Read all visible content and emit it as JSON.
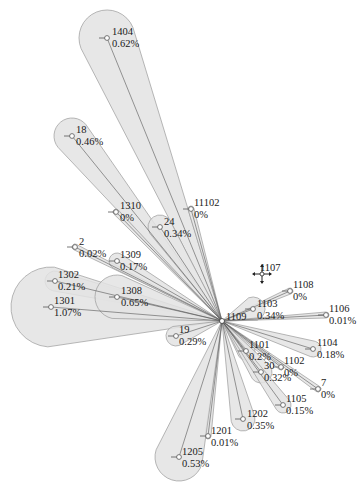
{
  "diagram": {
    "type": "radial-bubble-tree",
    "hub": {
      "x": 222,
      "y": 321
    },
    "colors": {
      "fill": "#e3e3e3",
      "stroke": "#9a9a9a",
      "line": "#555555",
      "text": "#1a1a1a"
    },
    "cursor": {
      "icon": "move-cursor-icon",
      "x": 262,
      "y": 274
    },
    "nodes": [
      {
        "id": "1404",
        "pct": "0.62%",
        "x": 107,
        "y": 38,
        "r": 28,
        "lx": 112,
        "ly": 26
      },
      {
        "id": "18",
        "pct": "0.46%",
        "x": 72,
        "y": 136,
        "r": 18,
        "lx": 76,
        "ly": 124
      },
      {
        "id": "1310",
        "pct": "0%",
        "x": 116,
        "y": 212,
        "r": 3,
        "lx": 120,
        "ly": 200
      },
      {
        "id": "24",
        "pct": "0.34%",
        "x": 160,
        "y": 227,
        "r": 12,
        "lx": 164,
        "ly": 216
      },
      {
        "id": "11102",
        "pct": "0%",
        "x": 191,
        "y": 209,
        "r": 3,
        "lx": 194,
        "ly": 197
      },
      {
        "id": "2",
        "pct": "0.02%",
        "x": 75,
        "y": 247,
        "r": 3,
        "lx": 79,
        "ly": 236
      },
      {
        "id": "1309",
        "pct": "0.17%",
        "x": 117,
        "y": 261,
        "r": 8,
        "lx": 120,
        "ly": 249
      },
      {
        "id": "1302",
        "pct": "0.21%",
        "x": 55,
        "y": 281,
        "r": 10,
        "lx": 58,
        "ly": 269
      },
      {
        "id": "1301",
        "pct": "1.07%",
        "x": 51,
        "y": 307,
        "r": 40,
        "lx": 54,
        "ly": 295
      },
      {
        "id": "1308",
        "pct": "0.65%",
        "x": 117,
        "y": 297,
        "r": 22,
        "lx": 121,
        "ly": 285
      },
      {
        "id": "19",
        "pct": "0.29%",
        "x": 176,
        "y": 336,
        "r": 10,
        "lx": 179,
        "ly": 324
      },
      {
        "id": "1107",
        "pct": "",
        "x": 262,
        "y": 274,
        "r": 0,
        "lx": 260,
        "ly": 262
      },
      {
        "id": "1108",
        "pct": "0%",
        "x": 290,
        "y": 291,
        "r": 3,
        "lx": 293,
        "ly": 279
      },
      {
        "id": "1103",
        "pct": "0.34%",
        "x": 253,
        "y": 309,
        "r": 12,
        "lx": 257,
        "ly": 298
      },
      {
        "id": "1109",
        "pct": "",
        "x": 226,
        "y": 321,
        "r": 0,
        "lx": 226,
        "ly": 311
      },
      {
        "id": "1106",
        "pct": "0.01%",
        "x": 326,
        "y": 315,
        "r": 3,
        "lx": 329,
        "ly": 303
      },
      {
        "id": "1104",
        "pct": "0.18%",
        "x": 313,
        "y": 349,
        "r": 8,
        "lx": 317,
        "ly": 337
      },
      {
        "id": "1101",
        "pct": "0.2%",
        "x": 246,
        "y": 351,
        "r": 9,
        "lx": 249,
        "ly": 339
      },
      {
        "id": "1102",
        "pct": "0%",
        "x": 281,
        "y": 367,
        "r": 3,
        "lx": 284,
        "ly": 355
      },
      {
        "id": "30",
        "pct": "0.32%",
        "x": 261,
        "y": 372,
        "r": 11,
        "lx": 264,
        "ly": 360
      },
      {
        "id": "7",
        "pct": "0%",
        "x": 318,
        "y": 389,
        "r": 3,
        "lx": 321,
        "ly": 377
      },
      {
        "id": "1105",
        "pct": "0.15%",
        "x": 283,
        "y": 405,
        "r": 8,
        "lx": 286,
        "ly": 393
      },
      {
        "id": "1202",
        "pct": "0.35%",
        "x": 243,
        "y": 419,
        "r": 12,
        "lx": 247,
        "ly": 408
      },
      {
        "id": "1201",
        "pct": "0.01%",
        "x": 208,
        "y": 436,
        "r": 3,
        "lx": 211,
        "ly": 425
      },
      {
        "id": "1205",
        "pct": "0.53%",
        "x": 179,
        "y": 457,
        "r": 24,
        "lx": 182,
        "ly": 446
      }
    ]
  }
}
